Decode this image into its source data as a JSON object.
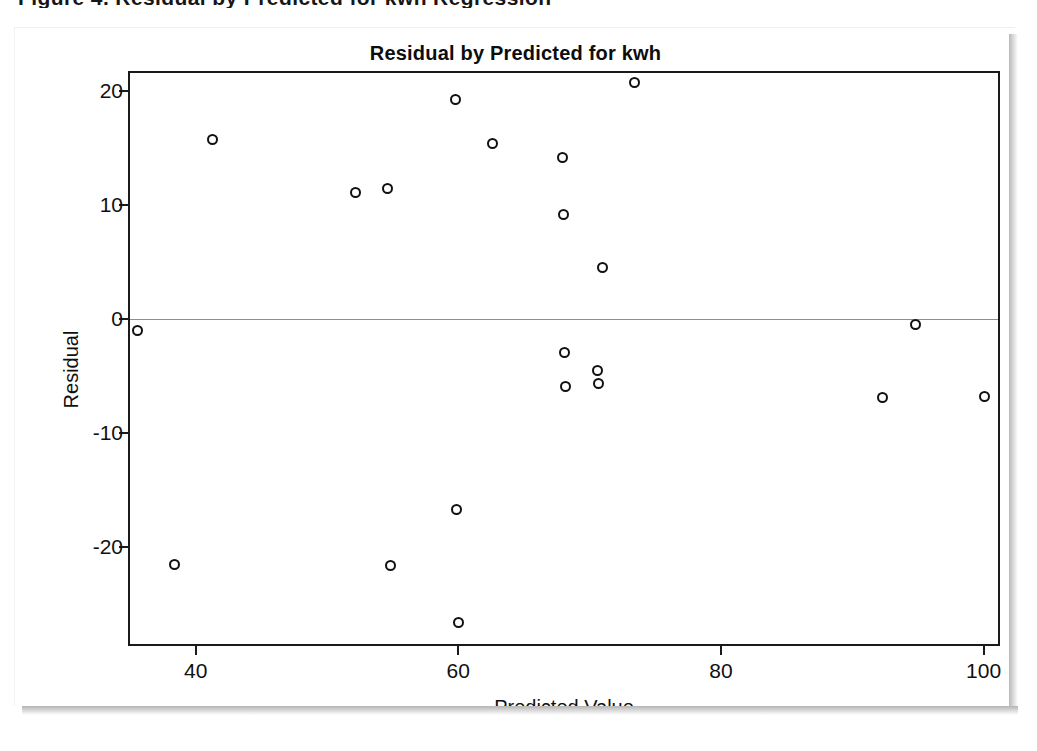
{
  "document": {
    "clipped_heading": "Figure 4. Residual by Predicted for kwh Regression"
  },
  "figure": {
    "title": "Residual by Predicted for kwh",
    "x_axis_title": "Predicted Value",
    "y_axis_title": "Residual",
    "marker_color": "#111111",
    "frame_color": "#1a1a1a",
    "zero_line_color": "#8e8e8e",
    "background_color": "#ffffff"
  },
  "chart_data": {
    "type": "scatter",
    "title": "Residual by Predicted for kwh",
    "xlabel": "Predicted Value",
    "ylabel": "Residual",
    "xlim": [
      35.0,
      101.1
    ],
    "ylim": [
      -28.5,
      21.6
    ],
    "xticks": [
      40,
      60,
      80,
      100
    ],
    "yticks": [
      20,
      10,
      0,
      -10,
      -20
    ],
    "xticklabels": [
      "40",
      "60",
      "80",
      "100"
    ],
    "yticklabels": [
      "20",
      "10",
      "0",
      "-10",
      "-20"
    ],
    "grid": false,
    "legend": null,
    "reference_lines": [
      {
        "axis": "y",
        "value": 0,
        "style": "solid"
      }
    ],
    "marker": "open-circle",
    "n_points": 20,
    "points": [
      {
        "x": 35.6,
        "y": -1.0
      },
      {
        "x": 38.4,
        "y": -21.5
      },
      {
        "x": 41.3,
        "y": 15.8
      },
      {
        "x": 52.2,
        "y": 11.1
      },
      {
        "x": 54.6,
        "y": 11.5
      },
      {
        "x": 54.8,
        "y": -21.6
      },
      {
        "x": 59.8,
        "y": 19.3
      },
      {
        "x": 59.9,
        "y": -16.7
      },
      {
        "x": 60.0,
        "y": -26.6
      },
      {
        "x": 62.6,
        "y": 15.4
      },
      {
        "x": 67.9,
        "y": 14.2
      },
      {
        "x": 68.0,
        "y": 9.2
      },
      {
        "x": 68.1,
        "y": -2.9
      },
      {
        "x": 68.2,
        "y": -5.9
      },
      {
        "x": 70.6,
        "y": -4.5
      },
      {
        "x": 70.7,
        "y": -5.6
      },
      {
        "x": 71.0,
        "y": 4.5
      },
      {
        "x": 73.4,
        "y": 20.8
      },
      {
        "x": 92.3,
        "y": -6.9
      },
      {
        "x": 94.8,
        "y": -0.5
      },
      {
        "x": 100.1,
        "y": -6.8
      }
    ]
  }
}
